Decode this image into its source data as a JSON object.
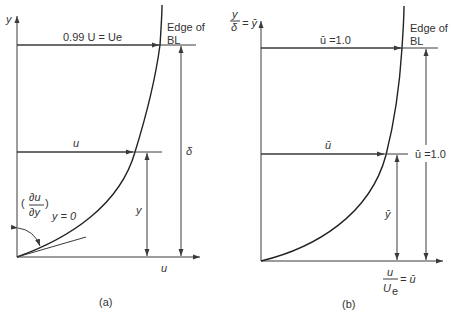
{
  "figure": {
    "panel_a": {
      "caption": "(a)",
      "y_axis_label": "y",
      "x_axis_label": "u",
      "top_arrow_label": "0.99 U = Ue",
      "edge_label_line1": "Edge of",
      "edge_label_line2": "BL",
      "mid_arrow_label": "u",
      "y_height_label": "y",
      "delta_label": "δ",
      "derivative_num": "∂u",
      "derivative_den": "∂y",
      "derivative_sub": "y = 0"
    },
    "panel_b": {
      "caption": "(b)",
      "y_axis_num": "y",
      "y_axis_den": "δ",
      "y_axis_eq": "= ȳ",
      "top_arrow_label": "ū =1.0",
      "edge_label_line1": "Edge of",
      "edge_label_line2": "BL",
      "mid_arrow_label": "ū",
      "right_label": "ū =1.0",
      "y_height_label": "ȳ",
      "x_axis_num": "u",
      "x_axis_den": "U",
      "x_axis_den_sub": "e",
      "x_axis_eq": "= ū"
    },
    "colors": {
      "line": "#3a3a3a",
      "curve": "#222222",
      "text": "#333333"
    }
  }
}
